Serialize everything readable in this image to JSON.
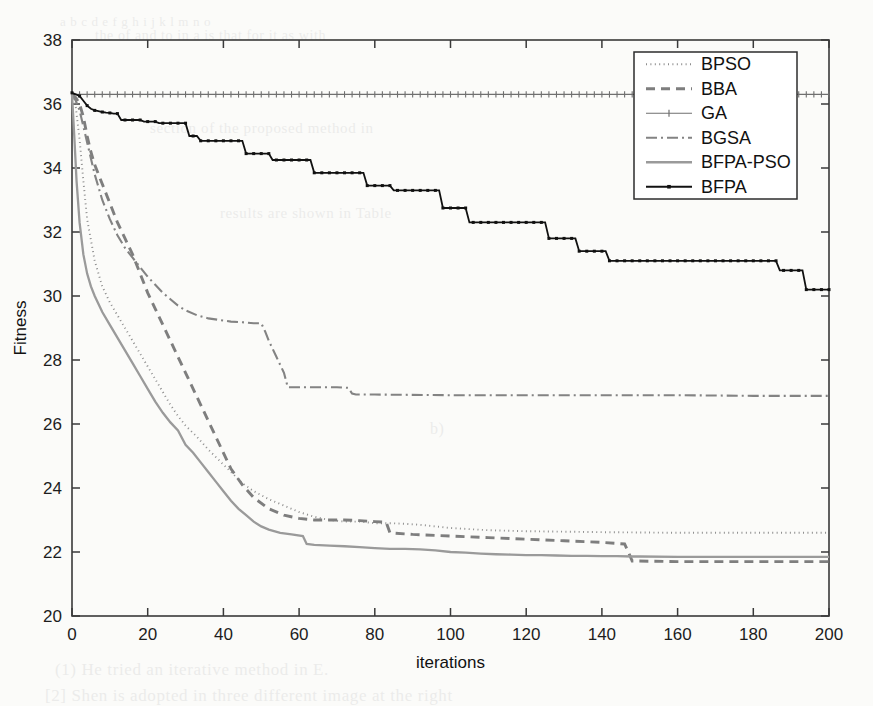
{
  "figure": {
    "background_color": "#fbfbf9",
    "plot_area": {
      "left": 72,
      "top": 40,
      "right": 829,
      "bottom": 616
    },
    "frame_color": "#3a3a3a"
  },
  "ghost_text": [
    {
      "text": "a  b  c  d  e  f  g  h  i  j  k  l  m  n  o",
      "x": 60,
      "y": 14,
      "size": 13
    },
    {
      "text": "the  of  and  to  in  a  is  that  for  it  as  with",
      "x": 95,
      "y": 28,
      "size": 14
    },
    {
      "text": "section  of  the  proposed  method  in",
      "x": 150,
      "y": 120,
      "size": 15
    },
    {
      "text": "results  are  shown  in  Table",
      "x": 220,
      "y": 205,
      "size": 15
    },
    {
      "text": "b)",
      "x": 430,
      "y": 420,
      "size": 16
    },
    {
      "text": "(1) He  tried  an  iterative  method  in  E.",
      "x": 55,
      "y": 660,
      "size": 17
    },
    {
      "text": "[2]  Shen  is  adopted  in  three  different  image  at  the  right",
      "x": 45,
      "y": 686,
      "size": 17
    }
  ],
  "chart_data": {
    "type": "line",
    "title": "",
    "xlabel": "iterations",
    "ylabel": "Fitness",
    "xlim": [
      0,
      200
    ],
    "ylim": [
      20,
      38
    ],
    "xticks": [
      0,
      20,
      40,
      60,
      80,
      100,
      120,
      140,
      160,
      180,
      200
    ],
    "yticks": [
      20,
      22,
      24,
      26,
      28,
      30,
      32,
      34,
      36,
      38
    ],
    "grid": false,
    "legend_position": "top-right",
    "series": [
      {
        "name": "BPSO",
        "color": "#8d8d8d",
        "width": 1.9,
        "dash": "1,3.4",
        "marker": "none",
        "x": [
          0,
          1,
          2,
          3,
          4,
          6,
          8,
          10,
          12,
          14,
          16,
          18,
          20,
          22,
          24,
          26,
          28,
          30,
          33,
          36,
          39,
          42,
          45,
          48,
          52,
          56,
          60,
          64,
          68,
          72,
          76,
          80,
          84,
          88,
          92,
          96,
          100,
          110,
          120,
          140,
          160,
          180,
          200
        ],
        "y": [
          36.3,
          35.9,
          34.9,
          33.6,
          32.4,
          31.1,
          30.3,
          29.8,
          29.4,
          29.0,
          28.6,
          28.2,
          27.8,
          27.4,
          27.0,
          26.6,
          26.25,
          25.95,
          25.6,
          25.2,
          24.85,
          24.5,
          24.15,
          23.9,
          23.65,
          23.45,
          23.25,
          23.1,
          23.0,
          22.95,
          22.95,
          22.9,
          22.9,
          22.88,
          22.85,
          22.8,
          22.75,
          22.68,
          22.65,
          22.62,
          22.6,
          22.6,
          22.6
        ]
      },
      {
        "name": "BBA",
        "color": "#7e7e7e",
        "width": 2.9,
        "dash": "9,6",
        "marker": "none",
        "x": [
          0,
          1,
          2,
          3,
          4,
          5,
          6,
          8,
          10,
          12,
          14,
          16,
          18,
          20,
          22,
          24,
          26,
          28,
          30,
          32,
          34,
          36,
          38,
          40,
          42,
          45,
          48,
          52,
          56,
          60,
          64,
          68,
          72,
          76,
          80,
          83,
          84,
          90,
          100,
          110,
          120,
          130,
          140,
          146,
          147,
          148,
          160,
          180,
          200
        ],
        "y": [
          36.3,
          36.2,
          36.0,
          35.6,
          35.0,
          34.5,
          34.1,
          33.5,
          32.9,
          32.3,
          31.8,
          31.3,
          30.7,
          30.1,
          29.6,
          29.1,
          28.6,
          28.1,
          27.6,
          27.1,
          26.6,
          26.1,
          25.6,
          25.1,
          24.6,
          24.1,
          23.7,
          23.35,
          23.15,
          23.05,
          23.0,
          23.0,
          23.0,
          22.98,
          22.95,
          22.93,
          22.6,
          22.55,
          22.5,
          22.45,
          22.4,
          22.35,
          22.3,
          22.25,
          22.0,
          21.72,
          21.7,
          21.7,
          21.7
        ]
      },
      {
        "name": "GA",
        "color": "#6f6f6f",
        "width": 1.1,
        "dash": "none",
        "marker": "tick",
        "x": [
          0,
          200
        ],
        "y": [
          36.3,
          36.3
        ]
      },
      {
        "name": "BGSA",
        "color": "#838383",
        "width": 2.1,
        "dash": "11,4,2,4",
        "marker": "none",
        "x": [
          0,
          1,
          2,
          3,
          4,
          5,
          6,
          7,
          8,
          10,
          12,
          14,
          16,
          18,
          20,
          22,
          24,
          26,
          28,
          30,
          33,
          36,
          39,
          42,
          45,
          48,
          50,
          51,
          52,
          54,
          56,
          57,
          60,
          65,
          70,
          73,
          74,
          75,
          80,
          100,
          120,
          140,
          160,
          180,
          200
        ],
        "y": [
          36.3,
          36.1,
          35.8,
          35.3,
          34.8,
          34.3,
          33.8,
          33.4,
          33.0,
          32.4,
          31.9,
          31.5,
          31.2,
          30.9,
          30.6,
          30.35,
          30.1,
          29.9,
          29.7,
          29.55,
          29.4,
          29.3,
          29.25,
          29.2,
          29.18,
          29.15,
          29.15,
          28.9,
          28.6,
          28.1,
          27.6,
          27.15,
          27.15,
          27.15,
          27.15,
          27.13,
          26.95,
          26.92,
          26.92,
          26.9,
          26.9,
          26.9,
          26.9,
          26.88,
          26.88
        ]
      },
      {
        "name": "BFPA-PSO",
        "color": "#9a9a9a",
        "width": 2.3,
        "dash": "none",
        "marker": "none",
        "x": [
          0,
          0.6,
          1.2,
          2,
          3,
          4,
          5,
          6,
          8,
          10,
          12,
          14,
          16,
          18,
          20,
          22,
          24,
          26,
          28,
          30,
          32,
          34,
          36,
          38,
          40,
          42,
          44,
          46,
          48,
          50,
          52,
          55,
          58,
          61,
          62,
          64,
          68,
          72,
          76,
          80,
          84,
          88,
          92,
          96,
          100,
          104,
          108,
          112,
          116,
          120,
          124,
          128,
          132,
          136,
          140,
          144,
          148,
          150,
          160,
          170,
          180,
          190,
          200
        ],
        "y": [
          36.3,
          35.0,
          33.6,
          32.3,
          31.3,
          30.7,
          30.3,
          30.0,
          29.5,
          29.1,
          28.7,
          28.3,
          27.9,
          27.5,
          27.1,
          26.7,
          26.35,
          26.05,
          25.8,
          25.35,
          25.1,
          24.8,
          24.5,
          24.2,
          23.9,
          23.6,
          23.35,
          23.15,
          22.95,
          22.8,
          22.7,
          22.6,
          22.55,
          22.5,
          22.25,
          22.22,
          22.2,
          22.18,
          22.15,
          22.12,
          22.1,
          22.1,
          22.08,
          22.05,
          22.0,
          21.98,
          21.95,
          21.93,
          21.92,
          21.9,
          21.9,
          21.89,
          21.88,
          21.88,
          21.87,
          21.87,
          21.86,
          21.86,
          21.85,
          21.85,
          21.85,
          21.85,
          21.85
        ]
      },
      {
        "name": "BFPA",
        "color": "#111111",
        "width": 1.8,
        "dash": "none",
        "marker": "dot",
        "x": [
          0,
          1,
          2,
          3,
          4,
          5,
          6,
          7,
          8,
          9,
          10,
          11,
          12,
          13,
          14,
          18,
          19,
          22,
          23,
          30,
          31,
          33,
          34,
          45,
          46,
          52,
          53,
          63,
          64,
          77,
          78,
          84,
          85,
          97,
          98,
          104,
          105,
          125,
          126,
          133,
          134,
          141,
          142,
          160,
          161,
          186,
          187,
          193,
          194,
          200
        ],
        "y": [
          36.35,
          36.3,
          36.25,
          36.1,
          35.95,
          35.85,
          35.8,
          35.78,
          35.75,
          35.73,
          35.72,
          35.7,
          35.7,
          35.5,
          35.5,
          35.5,
          35.45,
          35.45,
          35.4,
          35.4,
          35.0,
          35.0,
          34.85,
          34.85,
          34.45,
          34.45,
          34.25,
          34.25,
          33.85,
          33.85,
          33.45,
          33.45,
          33.3,
          33.3,
          32.75,
          32.75,
          32.3,
          32.3,
          31.8,
          31.8,
          31.4,
          31.4,
          31.1,
          31.1,
          31.1,
          31.1,
          30.8,
          30.8,
          30.2,
          30.2
        ]
      }
    ]
  },
  "legend": {
    "entries": [
      {
        "label": "BPSO"
      },
      {
        "label": "BBA"
      },
      {
        "label": "GA"
      },
      {
        "label": "BGSA"
      },
      {
        "label": "BFPA-PSO"
      },
      {
        "label": "BFPA"
      }
    ]
  }
}
